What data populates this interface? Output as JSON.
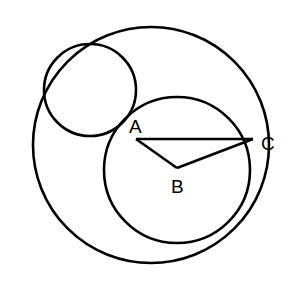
{
  "diagram": {
    "type": "geometry",
    "stroke_color": "#000000",
    "background": "#ffffff",
    "circles": [
      {
        "name": "large-circle",
        "cx": 151,
        "cy": 145,
        "r": 118
      },
      {
        "name": "small-circle",
        "cx": 90,
        "cy": 90,
        "r": 46
      },
      {
        "name": "medium-circle",
        "cx": 177,
        "cy": 170,
        "r": 73
      }
    ],
    "points": {
      "A": {
        "label": "A",
        "x": 136,
        "y": 139,
        "label_x": 129,
        "label_y": 133
      },
      "B": {
        "label": "B",
        "x": 177,
        "y": 168,
        "label_x": 171,
        "label_y": 193
      },
      "C": {
        "label": "C",
        "x": 253,
        "y": 139,
        "label_x": 261,
        "label_y": 150
      }
    },
    "segments": [
      {
        "from": "A",
        "to": "C"
      },
      {
        "from": "A",
        "to": "B"
      },
      {
        "from": "B",
        "to": "C"
      }
    ]
  }
}
